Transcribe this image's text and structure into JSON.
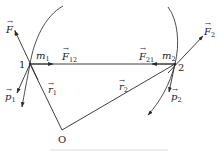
{
  "diagram": {
    "colors": {
      "stroke": "#2a2a2a",
      "background": "#ffffff"
    },
    "points": {
      "p1": {
        "label": "1",
        "mass": "m",
        "mass_sub": "1",
        "x": 30,
        "y": 64
      },
      "p2": {
        "label": "2",
        "mass": "m",
        "mass_sub": "2",
        "x": 175,
        "y": 64
      },
      "origin": {
        "label": "O",
        "x": 62,
        "y": 130
      }
    },
    "vectors": {
      "F1": {
        "sym": "F",
        "sub": "1"
      },
      "F2": {
        "sym": "F",
        "sub": "2"
      },
      "F12": {
        "sym": "F",
        "sub": "12"
      },
      "F21": {
        "sym": "F",
        "sub": "21"
      },
      "p1": {
        "sym": "p",
        "sub": "1"
      },
      "p2": {
        "sym": "p",
        "sub": "2"
      },
      "r1": {
        "sym": "r",
        "sub": "1"
      },
      "r2": {
        "sym": "r",
        "sub": "2"
      }
    },
    "arrow_glyph": "→"
  }
}
